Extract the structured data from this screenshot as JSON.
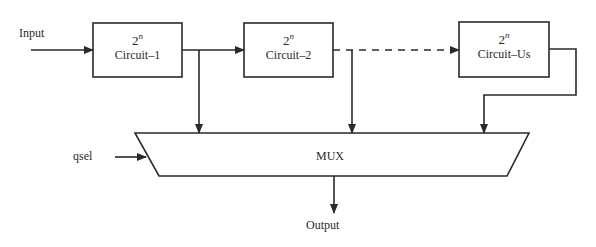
{
  "diagram": {
    "input_label": "Input",
    "select_label": "qsel",
    "output_label": "Output",
    "mux_label": "MUX",
    "blocks": [
      {
        "base": "2",
        "exponent": "n",
        "name": "Circuit–1"
      },
      {
        "base": "2",
        "exponent": "n",
        "name": "Circuit–2"
      },
      {
        "base": "2",
        "exponent": "n",
        "name": "Circuit–Us"
      }
    ],
    "connections": [
      {
        "from": "Input",
        "to": "Circuit–1",
        "style": "solid"
      },
      {
        "from": "Circuit–1",
        "to": "Circuit–2",
        "style": "solid"
      },
      {
        "from": "Circuit–2",
        "to": "Circuit–Us",
        "style": "dashed"
      },
      {
        "from": "Circuit–1",
        "to": "MUX",
        "style": "solid"
      },
      {
        "from": "Circuit–2",
        "to": "MUX",
        "style": "solid"
      },
      {
        "from": "Circuit–Us",
        "to": "MUX",
        "style": "solid"
      },
      {
        "from": "qsel",
        "to": "MUX",
        "style": "solid"
      },
      {
        "from": "MUX",
        "to": "Output",
        "style": "solid"
      }
    ]
  }
}
